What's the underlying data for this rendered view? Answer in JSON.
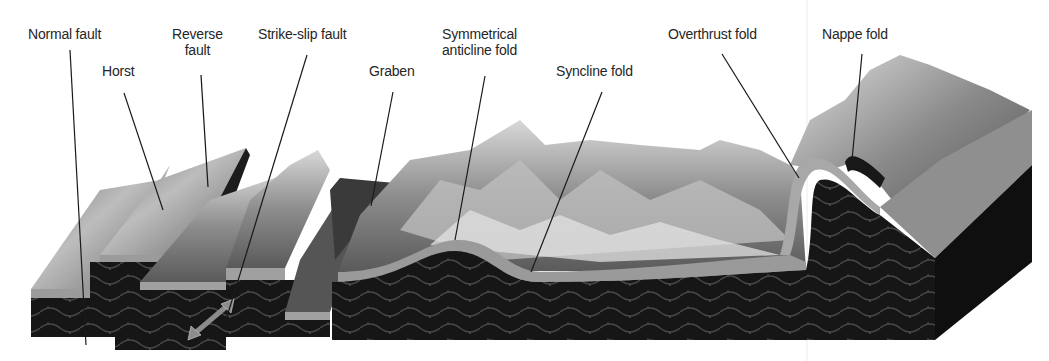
{
  "figure": {
    "width": 1049,
    "height": 361,
    "colors": {
      "background": "#ffffff",
      "label_text": "#262626",
      "leader_line": "#1a1a1a",
      "rock_dark": "#141414",
      "rock_strata": "#3a3a3a",
      "top_layer": "#9a9a9a",
      "terrain_light": "#cfcfcf",
      "terrain_mid": "#8a8a8a",
      "terrain_dark": "#4a4a4a",
      "arrow": "#8c8c8c",
      "guide_line": "#e6e6e6"
    }
  },
  "labels": [
    {
      "id": "normal-fault",
      "lines": [
        "Normal fault"
      ],
      "x": 72,
      "y": 33,
      "leader": [
        70,
        50,
        86,
        345
      ]
    },
    {
      "id": "horst",
      "lines": [
        "Horst"
      ],
      "x": 122,
      "y": 70,
      "leader": [
        124,
        93,
        163,
        210
      ]
    },
    {
      "id": "reverse-fault",
      "lines": [
        "Reverse",
        "fault"
      ],
      "x": 199,
      "y": 33,
      "leader": [
        201,
        75,
        208,
        187
      ]
    },
    {
      "id": "strike-slip-fault",
      "lines": [
        "Strike-slip fault"
      ],
      "x": 307,
      "y": 33,
      "leader": [
        307,
        55,
        226,
        320
      ]
    },
    {
      "id": "graben",
      "lines": [
        "Graben"
      ],
      "x": 396,
      "y": 70,
      "leader": [
        393,
        92,
        371,
        206
      ]
    },
    {
      "id": "symmetrical-anticline-fold",
      "lines": [
        "Symmetrical",
        "anticline fold"
      ],
      "x": 489,
      "y": 33,
      "leader": [
        485,
        76,
        455,
        240
      ]
    },
    {
      "id": "syncline-fold",
      "lines": [
        "Syncline fold"
      ],
      "x": 604,
      "y": 70,
      "leader": [
        602,
        92,
        531,
        272
      ]
    },
    {
      "id": "overthrust-fold",
      "lines": [
        "Overthrust fold"
      ],
      "x": 722,
      "y": 33,
      "leader": [
        722,
        54,
        799,
        178
      ]
    },
    {
      "id": "nappe-fold",
      "lines": [
        "Nappe fold"
      ],
      "x": 863,
      "y": 33,
      "leader": [
        862,
        54,
        852,
        160
      ]
    }
  ],
  "arrow": {
    "id": "strike-slip-arrow",
    "direction": "bidirectional",
    "from": [
      192,
      336
    ],
    "to": [
      230,
      303
    ]
  }
}
